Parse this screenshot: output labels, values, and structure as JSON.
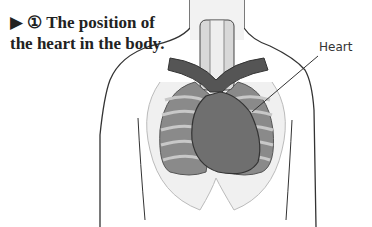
{
  "caption": {
    "marker": "▶",
    "number": "①",
    "line1": "The position of",
    "line2": "the heart in the body."
  },
  "labels": {
    "heart": "Heart"
  },
  "colors": {
    "outline": "#333333",
    "lung": "#8a8a8a",
    "heart": "#6f6f6f",
    "vessel": "#555555",
    "rib": "#cfcfcf",
    "background": "#ffffff"
  }
}
